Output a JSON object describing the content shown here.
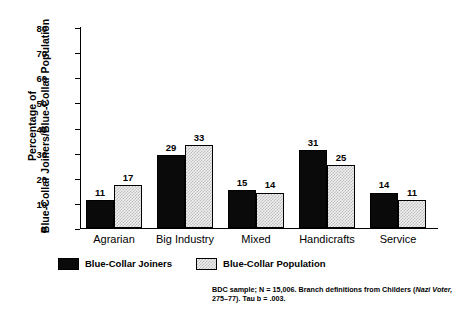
{
  "chart_data": {
    "type": "bar",
    "title": "",
    "subtitle": "",
    "xlabel": "",
    "ylabel": "Percentage of Blue-Collar Joiners/Blue-Collar Population",
    "ylabel_lines": [
      "Percentage of",
      "Blue-Collar Joiners/Blue-Collar Population"
    ],
    "categories": [
      "Agrarian",
      "Big Industry",
      "Mixed",
      "Handicrafts",
      "Service"
    ],
    "series": [
      {
        "name": "Blue-Collar Joiners",
        "values": [
          11,
          29,
          15,
          31,
          14
        ],
        "color": "#0a0a0a",
        "fill": "solid-black"
      },
      {
        "name": "Blue-Collar Population",
        "values": [
          17,
          33,
          14,
          25,
          11
        ],
        "color": "#efefef",
        "fill": "light-stipple"
      }
    ],
    "ylim": [
      0,
      80
    ],
    "yticks": [
      0,
      10,
      20,
      30,
      40,
      50,
      60,
      70,
      80
    ],
    "ytick_labels": [
      "0",
      "10",
      "20",
      "30",
      "40",
      "50",
      "60",
      "70",
      "80"
    ],
    "grid": false,
    "data_labels": true,
    "legend_position": "bottom-left",
    "axis_color": "#000000"
  },
  "legend": {
    "entries": [
      {
        "label": "Blue-Collar Joiners",
        "swatch": "dark"
      },
      {
        "label": "Blue-Collar Population",
        "swatch": "light"
      }
    ]
  },
  "footnote": {
    "line1_a": "BDC sample; N = 15,006. Branch definitions from Childers (",
    "line1_italic": "Nazi Voter,",
    "line2": "275–77). Tau b = .003."
  }
}
